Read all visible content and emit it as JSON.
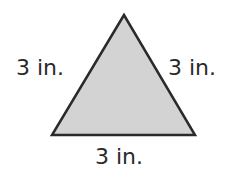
{
  "diagram": {
    "shape": "equilateral-triangle",
    "fill_color": "#d3d3d3",
    "stroke_color": "#2a2a2a",
    "sides": {
      "left": "3 in.",
      "right": "3 in.",
      "bottom": "3 in."
    }
  }
}
